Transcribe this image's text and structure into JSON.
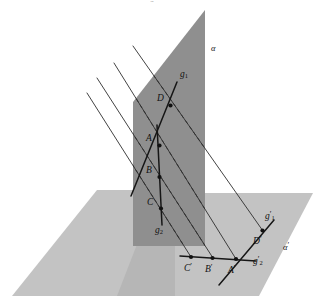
{
  "figure": {
    "title_fragment": "g",
    "type": "geometry-diagram",
    "colors": {
      "vertical_plane_fill": "#8f8f8f",
      "horizontal_plane_fill": "#c2c2c2",
      "horizontal_plane_overlap_fill": "#b4b4b4",
      "line_stroke": "#1a1a1a",
      "projector_stroke": "#333333",
      "background": "#ffffff"
    },
    "planes": [
      {
        "name": "alpha",
        "label": "α",
        "label_x": 211,
        "label_y": 44,
        "orientation": "vertical"
      },
      {
        "name": "alpha-prime",
        "label": "α",
        "prime": "′",
        "label_x": 283,
        "label_y": 242,
        "orientation": "horizontal"
      }
    ],
    "lines": [
      {
        "name": "g1",
        "base": "g",
        "sub": "1",
        "label_x": 180,
        "label_y": 74,
        "plane": "alpha"
      },
      {
        "name": "g2",
        "base": "g",
        "sub": "2",
        "label_x": 155,
        "label_y": 229,
        "plane": "alpha"
      },
      {
        "name": "g1-prime",
        "base": "g",
        "sub": "1",
        "prime": "′",
        "label_x": 266,
        "label_y": 214,
        "plane": "alpha-prime"
      },
      {
        "name": "g2-prime",
        "base": "g",
        "sub": "2",
        "prime": "′",
        "label_x": 254,
        "label_y": 261,
        "plane": "alpha-prime"
      }
    ],
    "points": [
      {
        "name": "A",
        "label": "A",
        "x": 159.5,
        "y": 145.5,
        "label_x": 146,
        "label_y": 139
      },
      {
        "name": "B",
        "label": "B",
        "x": 159.5,
        "y": 177.0,
        "label_x": 146,
        "label_y": 171
      },
      {
        "name": "C",
        "label": "C",
        "x": 161.0,
        "y": 208.5,
        "label_x": 147,
        "label_y": 202
      },
      {
        "name": "D",
        "label": "D",
        "x": 170.5,
        "y": 105.5,
        "label_x": 157,
        "label_y": 99
      },
      {
        "name": "A-prime",
        "label": "A",
        "prime": "′",
        "x": 236.0,
        "y": 259.0,
        "label_x": 228,
        "label_y": 272
      },
      {
        "name": "B-prime",
        "label": "B",
        "prime": "′",
        "x": 212.5,
        "y": 258.0,
        "label_x": 205,
        "label_y": 271
      },
      {
        "name": "C-prime",
        "label": "C",
        "prime": "′",
        "x": 191.0,
        "y": 257.0,
        "label_x": 184,
        "label_y": 270
      },
      {
        "name": "D-prime",
        "label": "D",
        "prime": "′",
        "x": 262.5,
        "y": 230.5,
        "label_x": 254,
        "label_y": 243
      }
    ],
    "projector_rays": [
      {
        "name": "ray-through-D",
        "x1": 133,
        "y1": 46,
        "x2": 263,
        "y2": 231
      },
      {
        "name": "ray-through-A",
        "x1": 114,
        "y1": 63,
        "x2": 236,
        "y2": 259
      },
      {
        "name": "ray-through-B",
        "x1": 97,
        "y1": 78,
        "x2": 213,
        "y2": 258
      },
      {
        "name": "ray-through-C",
        "x1": 87,
        "y1": 93,
        "x2": 191,
        "y2": 257
      }
    ]
  }
}
